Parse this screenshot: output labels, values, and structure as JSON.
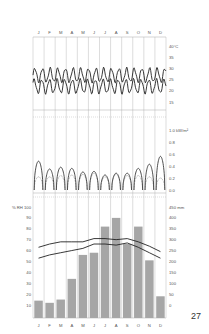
{
  "page_number": "27",
  "months": [
    "J",
    "F",
    "M",
    "A",
    "M",
    "J",
    "J",
    "A",
    "S",
    "O",
    "N",
    "D"
  ],
  "chart_data": [
    {
      "type": "line",
      "title": "Daily temperature",
      "ylabel": "°C",
      "yticks": [
        "40°C",
        "35",
        "30",
        "25",
        "20",
        "15"
      ],
      "ylim": [
        15,
        40
      ],
      "grid": true,
      "series": [
        {
          "name": "Daily maximum temperature",
          "pattern": "oscillating",
          "range": [
            24,
            30
          ]
        },
        {
          "name": "Daily minimum temperature",
          "pattern": "oscillating",
          "range": [
            19,
            25
          ]
        }
      ]
    },
    {
      "type": "line",
      "title": "Solar radiation (daily profile per month)",
      "ylabel": "kW/m²",
      "yticks": [
        "1.0 kW/m²",
        "0.8",
        "0.6",
        "0.4",
        "0.2",
        "0.0"
      ],
      "ylim": [
        0,
        1.0
      ],
      "categories": [
        "J",
        "F",
        "M",
        "A",
        "M",
        "J",
        "J",
        "A",
        "S",
        "O",
        "N",
        "D"
      ],
      "series": [
        {
          "name": "Global radiation peak",
          "values": [
            0.48,
            0.35,
            0.38,
            0.36,
            0.3,
            0.31,
            0.25,
            0.28,
            0.28,
            0.36,
            0.43,
            0.56
          ]
        },
        {
          "name": "Diffuse radiation peak",
          "values": [
            0.22,
            0.22,
            0.24,
            0.25,
            0.26,
            0.28,
            0.22,
            0.26,
            0.24,
            0.24,
            0.22,
            0.2
          ]
        }
      ]
    },
    {
      "type": "bar",
      "title": "Relative humidity and precipitation",
      "ylabel_left": "% RH",
      "ylabel_right": "mm",
      "yticks_left": [
        "% RH 100",
        "90",
        "80",
        "70",
        "60",
        "50",
        "40",
        "30",
        "20",
        "10"
      ],
      "yticks_right": [
        "450 mm",
        "400",
        "350",
        "300",
        "250",
        "200",
        "150",
        "100",
        "50",
        "0"
      ],
      "ylim_left": [
        10,
        100
      ],
      "ylim_right": [
        0,
        450
      ],
      "categories": [
        "J",
        "F",
        "M",
        "A",
        "M",
        "J",
        "J",
        "A",
        "S",
        "O",
        "N",
        "D"
      ],
      "series": [
        {
          "name": "Precipitation (mm)",
          "type": "bar",
          "values": [
            20,
            10,
            25,
            120,
            230,
            240,
            360,
            400,
            280,
            360,
            205,
            40
          ]
        },
        {
          "name": "RH maximum (%)",
          "type": "line",
          "values": [
            63,
            66,
            68,
            68,
            68,
            71,
            71,
            70,
            71,
            68,
            64,
            59
          ]
        },
        {
          "name": "RH minimum (%)",
          "type": "line",
          "values": [
            53,
            56,
            58,
            60,
            62,
            66,
            66,
            65,
            67,
            63,
            58,
            53
          ]
        }
      ]
    }
  ]
}
